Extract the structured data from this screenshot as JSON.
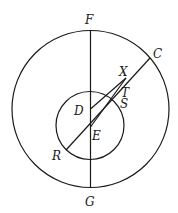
{
  "diagram": {
    "type": "geometry",
    "circles": [
      {
        "name": "outer",
        "center": "D",
        "cx": 90.5,
        "cy": 109,
        "r": 78.5
      },
      {
        "name": "inner",
        "center": "E",
        "cx": 90,
        "cy": 125.5,
        "r": 34
      }
    ],
    "points": {
      "F": {
        "x": 90.5,
        "y": 30
      },
      "G": {
        "x": 90.5,
        "y": 188
      },
      "C": {
        "x": 150,
        "y": 58
      },
      "X": {
        "x": 126,
        "y": 78
      },
      "D": {
        "x": 90.5,
        "y": 109
      },
      "E": {
        "x": 90.5,
        "y": 127
      },
      "S": {
        "x": 113,
        "y": 98
      },
      "T": {
        "x": 118,
        "y": 91
      },
      "R": {
        "x": 66,
        "y": 150
      }
    },
    "segments": [
      [
        "F",
        "G"
      ],
      [
        "R",
        "C"
      ],
      [
        "D",
        "X"
      ],
      [
        "E",
        "X"
      ]
    ],
    "labels": [
      {
        "text": "F",
        "x": 85,
        "y": 24
      },
      {
        "text": "C",
        "x": 153,
        "y": 58
      },
      {
        "text": "X",
        "x": 119,
        "y": 76
      },
      {
        "text": "T",
        "x": 121,
        "y": 97
      },
      {
        "text": "D",
        "x": 74,
        "y": 115
      },
      {
        "text": "S",
        "x": 120,
        "y": 108
      },
      {
        "text": "E",
        "x": 92,
        "y": 140
      },
      {
        "text": "R",
        "x": 52,
        "y": 160
      },
      {
        "text": "G",
        "x": 85,
        "y": 206
      }
    ]
  }
}
